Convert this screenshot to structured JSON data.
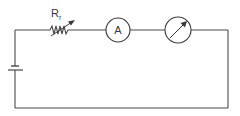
{
  "diagram": {
    "type": "circuit-schematic",
    "components": [
      {
        "id": "battery",
        "kind": "battery",
        "label": ""
      },
      {
        "id": "rheostat",
        "kind": "variable-resistor",
        "label": "R",
        "subscript": "r"
      },
      {
        "id": "ammeter",
        "kind": "ammeter",
        "label": "A"
      },
      {
        "id": "meter",
        "kind": "meter-dial",
        "label": ""
      }
    ],
    "connections": "series loop: battery → rheostat → ammeter → meter → back to battery",
    "colors": {
      "line": "#4a4a4a",
      "background": "#ffffff"
    }
  },
  "labels": {
    "resistor_main": "R",
    "resistor_sub": "r",
    "ammeter": "A"
  }
}
